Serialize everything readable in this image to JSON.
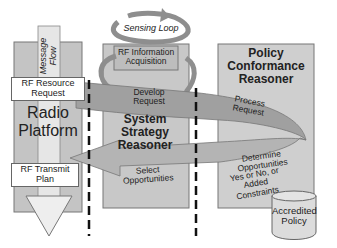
{
  "diagram": {
    "message_flow": "Message Flow",
    "sensing_loop": "Sensing Loop",
    "rf_information_acquisition": "RF Information Acquisition",
    "radio_platform": "Radio Platform",
    "system_strategy_reasoner": "System Strategy Reasoner",
    "policy_conformance_reasoner": "Policy Conformance Reasoner",
    "rf_resource_request": "RF Resource Request",
    "rf_transmit_plan": "RF Transmit Plan",
    "develop_request": "Develop Request",
    "process_request": "Process Request",
    "determine_opportunities": "Determine Opportunities",
    "yes_no_constraints": "Yes or No, or Added Constraints",
    "select_opportunities": "Select Opportunities",
    "accredited_policy": "Accredited Policy"
  },
  "colors": {
    "panel": "#c8c8c8",
    "panel_dark": "#a8a8a8",
    "arrow": "#9a9a9a",
    "border": "#666666"
  }
}
